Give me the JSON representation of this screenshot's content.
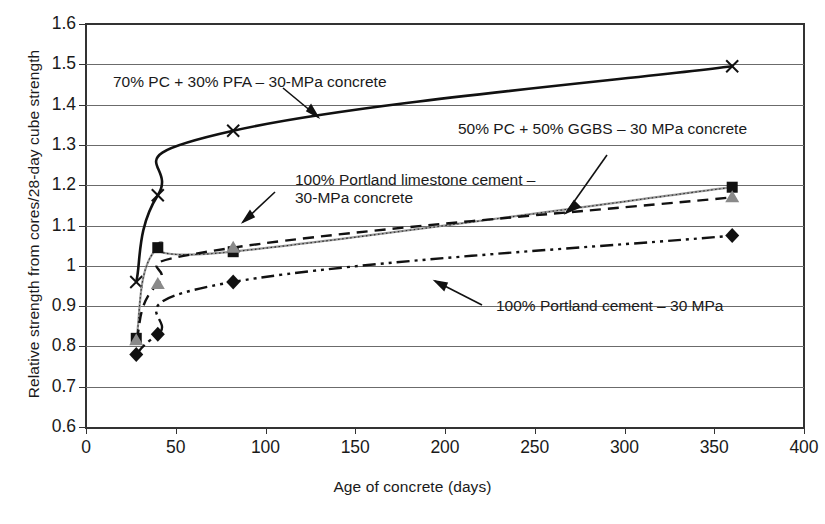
{
  "chart_data": {
    "type": "line",
    "title": "",
    "xlabel": "Age of concrete (days)",
    "ylabel": "Relative strength from cores/28-day cube strength",
    "xlim": [
      0,
      400
    ],
    "ylim": [
      0.6,
      1.6
    ],
    "xticks": [
      0,
      50,
      100,
      150,
      200,
      250,
      300,
      350,
      400
    ],
    "yticks": [
      "0.6",
      "0.7",
      "0.8",
      "0.9",
      "1",
      "1.1",
      "1.2",
      "1.3",
      "1.4",
      "1.5",
      "1.6"
    ],
    "grid": "horizontal",
    "legend": "annotations-with-leader-lines",
    "series": [
      {
        "name": "70% PC + 30% PFA – 30-MPa concrete",
        "marker": "x-cross",
        "line_style": "solid",
        "color": "#111111",
        "points": [
          [
            28,
            0.96
          ],
          [
            40,
            1.175
          ],
          [
            82,
            1.335
          ],
          [
            360,
            1.495
          ]
        ]
      },
      {
        "name": "100% Portland limestone cement – 30-MPa concrete",
        "marker": "square",
        "line_style": "solid-thin-gray",
        "color": "#8f8f8f",
        "points": [
          [
            28,
            0.82
          ],
          [
            40,
            1.045
          ],
          [
            82,
            1.035
          ],
          [
            360,
            1.195
          ]
        ]
      },
      {
        "name": "50% PC + 50% GGBS – 30 MPa concrete",
        "marker": "triangle",
        "line_style": "dashed",
        "color": "#111111",
        "points": [
          [
            28,
            0.815
          ],
          [
            40,
            0.955
          ],
          [
            82,
            1.045
          ],
          [
            360,
            1.17
          ]
        ]
      },
      {
        "name": "100% Portland cement – 30 MPa",
        "marker": "diamond",
        "line_style": "dash-dot-dot",
        "color": "#111111",
        "points": [
          [
            28,
            0.78
          ],
          [
            40,
            0.83
          ],
          [
            82,
            0.96
          ],
          [
            360,
            1.075
          ]
        ]
      }
    ],
    "annotations": [
      {
        "id": "pfa",
        "text": "70% PC + 30% PFA – 30-MPa concrete"
      },
      {
        "id": "ggbs",
        "text": "50% PC + 50% GGBS – 30 MPa concrete"
      },
      {
        "id": "limestone",
        "line1": "100% Portland limestone cement –",
        "line2": "30-MPa concrete"
      },
      {
        "id": "portland",
        "text": "100% Portland cement – 30 MPa"
      }
    ]
  }
}
